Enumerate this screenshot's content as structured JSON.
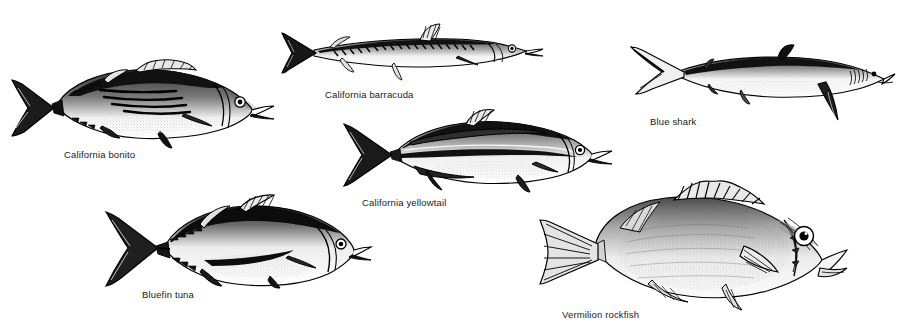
{
  "plate": {
    "title": "Pacific game fish identification plate",
    "background_color": "#ffffff",
    "ink_color": "#000000",
    "label_color": "#1a1a1a",
    "width": 904,
    "height": 332
  },
  "figures": [
    {
      "id": "california-bonito",
      "label": "California bonito",
      "label_x": 64,
      "label_y": 150,
      "art_x": 8,
      "art_y": 58,
      "art_w": 272,
      "art_h": 86,
      "orientation": "head-right",
      "features": "streamlined tuna-like body, dark oblique stripes on back, forked tail, two dorsal fins"
    },
    {
      "id": "california-barracuda",
      "label": "California barracuda",
      "label_x": 325,
      "label_y": 90,
      "art_x": 282,
      "art_y": 22,
      "art_w": 262,
      "art_h": 62,
      "orientation": "head-right",
      "features": "very elongate slender body, pointed jaw, two widely separated dorsal fins, forked tail"
    },
    {
      "id": "blue-shark",
      "label": "Blue shark",
      "label_x": 650,
      "label_y": 117,
      "art_x": 628,
      "art_y": 44,
      "art_w": 268,
      "art_h": 80,
      "orientation": "head-right",
      "features": "long conical snout, long pectoral fins, heterocercal tail with long upper lobe"
    },
    {
      "id": "california-yellowtail",
      "label": "California yellowtail",
      "label_x": 362,
      "label_y": 198,
      "art_x": 340,
      "art_y": 108,
      "art_w": 276,
      "art_h": 84,
      "orientation": "head-right",
      "features": "elongate jack body, dark lateral band, long soft dorsal and anal fins, deeply forked tail"
    },
    {
      "id": "bluefin-tuna",
      "label": "Bluefin tuna",
      "label_x": 142,
      "label_y": 290,
      "art_x": 104,
      "art_y": 198,
      "art_w": 268,
      "art_h": 90,
      "orientation": "head-right",
      "features": "deep robust body, very dark back, lunate tail, row of finlets, tall first dorsal"
    },
    {
      "id": "vermilion-rockfish",
      "label": "Vermilion rockfish",
      "label_x": 562,
      "label_y": 310,
      "art_x": 534,
      "art_y": 180,
      "art_w": 316,
      "art_h": 130,
      "orientation": "head-right",
      "features": "deep-bodied rockfish, spiny dorsal fin, large eye, spiny head ridges, large pectoral fin"
    }
  ]
}
